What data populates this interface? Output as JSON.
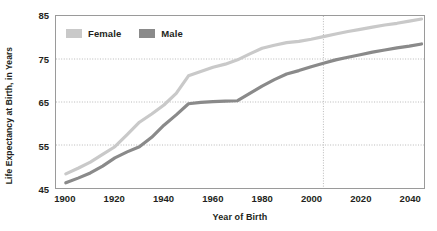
{
  "chart_data": {
    "type": "line",
    "title": "",
    "xlabel": "Year of Birth",
    "ylabel": "Life Expectancy at Birth, in Years",
    "xlim": [
      1896,
      2046
    ],
    "ylim": [
      45,
      85
    ],
    "xticks": [
      1900,
      1920,
      1940,
      1960,
      1980,
      2000,
      2020,
      2040
    ],
    "xtick_labels": [
      "1900",
      "1920",
      "1940",
      "1960",
      "1980",
      "2000",
      "2020",
      "2040"
    ],
    "yticks": [
      45,
      55,
      65,
      75,
      85
    ],
    "ytick_labels": [
      "45",
      "55",
      "65",
      "75",
      "85"
    ],
    "grid": "horizontal-dotted-plus-vertical-marker",
    "legend_position": "top-left-inside",
    "annotations": [
      {
        "kind": "vertical-dotted-line",
        "x": 2005,
        "label": ""
      }
    ],
    "x": [
      1900,
      1905,
      1910,
      1915,
      1920,
      1925,
      1930,
      1935,
      1940,
      1945,
      1950,
      1955,
      1960,
      1965,
      1970,
      1975,
      1980,
      1985,
      1990,
      1995,
      2000,
      2005,
      2010,
      2015,
      2020,
      2025,
      2030,
      2035,
      2040,
      2045
    ],
    "series": [
      {
        "name": "Female",
        "color": "#c9c9c9",
        "values": [
          48.3,
          49.6,
          51.0,
          52.8,
          54.6,
          57.4,
          60.3,
          62.2,
          64.3,
          67.0,
          71.1,
          72.1,
          73.1,
          73.8,
          74.8,
          76.2,
          77.5,
          78.2,
          78.8,
          79.1,
          79.6,
          80.2,
          80.8,
          81.4,
          81.9,
          82.4,
          82.9,
          83.3,
          83.8,
          84.3
        ]
      },
      {
        "name": "Male",
        "color": "#8a8a8a",
        "values": [
          46.2,
          47.3,
          48.5,
          50.1,
          52.0,
          53.4,
          54.6,
          56.8,
          59.6,
          62.0,
          64.6,
          64.9,
          65.1,
          65.2,
          65.3,
          67.0,
          68.7,
          70.2,
          71.5,
          72.3,
          73.2,
          74.0,
          74.8,
          75.4,
          76.0,
          76.6,
          77.1,
          77.6,
          78.0,
          78.5
        ]
      }
    ]
  },
  "legend": {
    "entries": [
      {
        "label": "Female",
        "swatch_color": "#c9c9c9"
      },
      {
        "label": "Male",
        "swatch_color": "#8a8a8a"
      }
    ]
  },
  "axes": {
    "x_title": "Year of Birth",
    "y_title": "Life Expectancy at Birth, in Years"
  },
  "style": {
    "frame_color": "#9a9a9a",
    "grid_color": "#b0b0b0",
    "text_color": "#231f20",
    "background": "#ffffff"
  }
}
